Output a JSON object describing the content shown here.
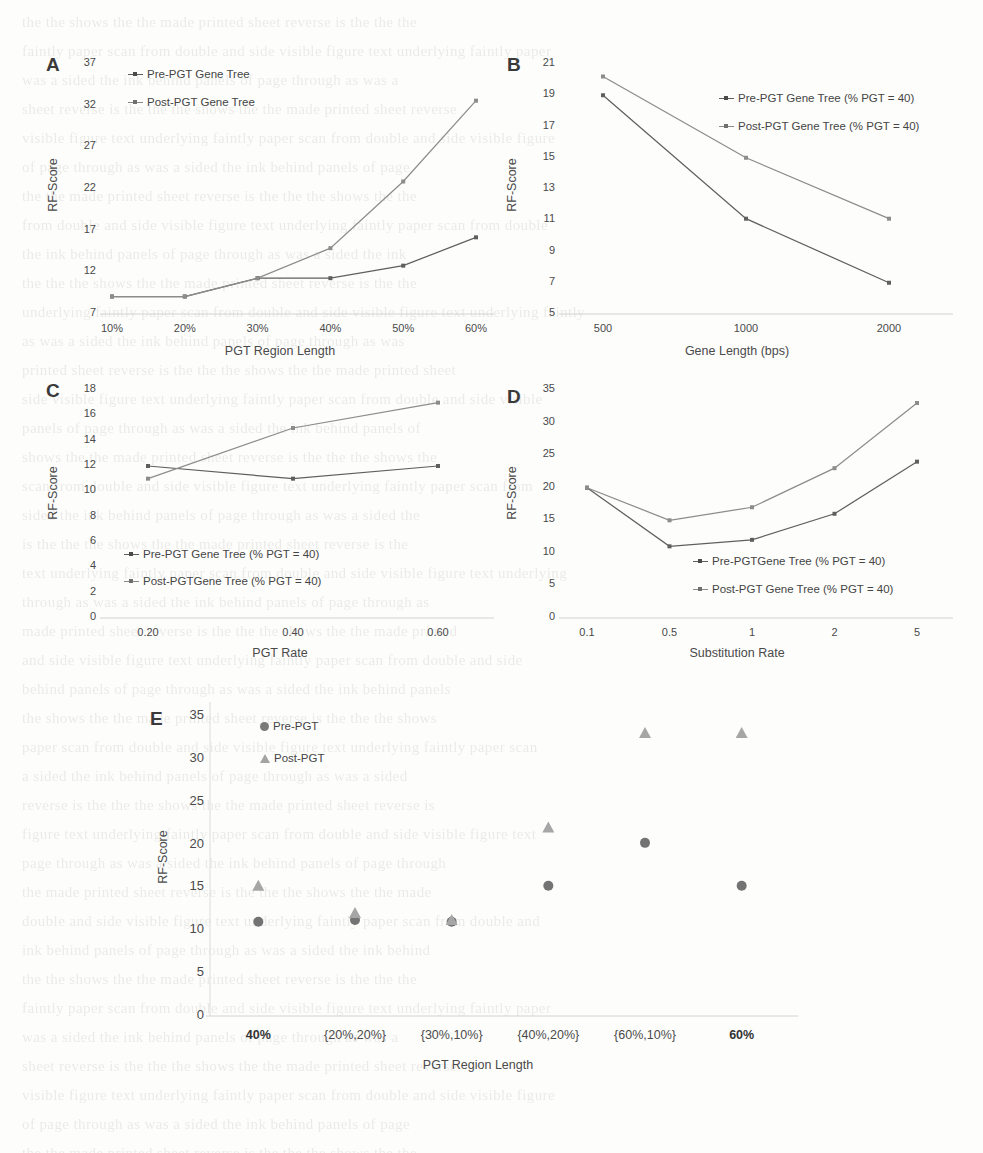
{
  "figure": {
    "panels": [
      "A",
      "B",
      "C",
      "D",
      "E"
    ]
  },
  "chart_data": [
    {
      "panel": "A",
      "type": "line",
      "title": "",
      "xlabel": "PGT  Region Length",
      "ylabel": "RF-Score",
      "categories": [
        "10%",
        "20%",
        "30%",
        "40%",
        "50%",
        "60%"
      ],
      "yticks": [
        7,
        12,
        17,
        22,
        27,
        32,
        37
      ],
      "ylim": [
        7,
        37
      ],
      "grid": false,
      "legend_position": "top-left",
      "series": [
        {
          "name": "Pre-PGT Gene Tree",
          "color": "#5f5f5f",
          "values": [
            9.1,
            9.1,
            11.3,
            11.3,
            12.8,
            16.2
          ]
        },
        {
          "name": "Post-PGT Gene Tree",
          "color": "#8c8c8c",
          "values": [
            9.1,
            9.1,
            11.3,
            14.9,
            22.9,
            32.6
          ]
        }
      ]
    },
    {
      "panel": "B",
      "type": "line",
      "title": "",
      "xlabel": "Gene Length (bps)",
      "ylabel": "RF-Score",
      "categories": [
        "500",
        "1000",
        "2000"
      ],
      "yticks": [
        5,
        7,
        9,
        11,
        13,
        15,
        17,
        19,
        21
      ],
      "ylim": [
        5,
        21
      ],
      "grid": false,
      "legend_position": "top-right",
      "series": [
        {
          "name": "Pre-PGT Gene Tree (% PGT = 40)",
          "color": "#5f5f5f",
          "values": [
            19.0,
            11.1,
            7.0
          ]
        },
        {
          "name": "Post-PGT Gene Tree (% PGT = 40)",
          "color": "#8c8c8c",
          "values": [
            20.2,
            15.0,
            11.1
          ]
        }
      ]
    },
    {
      "panel": "C",
      "type": "line",
      "title": "",
      "xlabel": "PGT Rate",
      "ylabel": "RF-Score",
      "categories": [
        "0.20",
        "0.40",
        "0.60"
      ],
      "yticks": [
        0,
        2,
        4,
        6,
        8,
        10,
        12,
        14,
        16,
        18
      ],
      "ylim": [
        0,
        18
      ],
      "grid": false,
      "legend_position": "bottom-left",
      "series": [
        {
          "name": "Pre-PGT Gene Tree (% PGT = 40)",
          "color": "#5f5f5f",
          "values": [
            12.0,
            11.0,
            12.0
          ]
        },
        {
          "name": "Post-PGTGene Tree (% PGT = 40)",
          "color": "#8c8c8c",
          "values": [
            11.0,
            15.0,
            17.0
          ]
        }
      ]
    },
    {
      "panel": "D",
      "type": "line",
      "title": "",
      "xlabel": "Substitution Rate",
      "ylabel": "RF-Score",
      "categories": [
        "0.1",
        "0.5",
        "1",
        "2",
        "5"
      ],
      "yticks": [
        0,
        5,
        10,
        15,
        20,
        25,
        30,
        35
      ],
      "ylim": [
        0,
        35
      ],
      "grid": false,
      "legend_position": "bottom-center",
      "series": [
        {
          "name": "Pre-PGTGene Tree (% PGT = 40)",
          "color": "#5f5f5f",
          "values": [
            20.0,
            11.0,
            12.0,
            16.0,
            24.0
          ]
        },
        {
          "name": "Post-PGT Gene Tree (% PGT = 40)",
          "color": "#8c8c8c",
          "values": [
            20.0,
            15.0,
            17.0,
            23.0,
            33.0
          ]
        }
      ]
    },
    {
      "panel": "E",
      "type": "scatter",
      "title": "",
      "xlabel": "PGT Region Length",
      "ylabel": "RF-Score",
      "categories": [
        "40%",
        "{20%,20%}",
        "{30%,10%}",
        "{40%,20%}",
        "{60%,10%}",
        "60%"
      ],
      "categories_bold": [
        true,
        false,
        false,
        false,
        false,
        true
      ],
      "yticks": [
        0,
        5,
        10,
        15,
        20,
        25,
        30,
        35
      ],
      "ylim": [
        0,
        35
      ],
      "grid": false,
      "legend_position": "top-left",
      "series": [
        {
          "name": "Pre-PGT",
          "marker": "circle",
          "color": "#737373",
          "values": [
            11.0,
            11.2,
            11.0,
            15.2,
            20.2,
            15.2
          ]
        },
        {
          "name": "Post-PGT",
          "marker": "triangle",
          "color": "#a6a6a6",
          "values": [
            15.2,
            12.0,
            11.2,
            22.0,
            33.0,
            33.0
          ]
        }
      ]
    }
  ],
  "bleed_text": "the text of the underlying page shows faintly through the paper as the scan was made from a printed double sided sheet and the reverse side ink is visible behind the figure panels"
}
